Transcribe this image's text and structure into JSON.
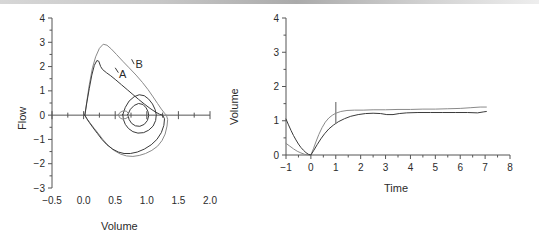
{
  "figure": {
    "background": "#ffffff",
    "line_color_primary": "#3a3a3a",
    "line_color_secondary": "#8a8a8a",
    "axis_color": "#555555",
    "text_color": "#2b2b2b"
  },
  "panels": {
    "left": {
      "name": "flow-volume-loop",
      "xlabel": "Volume",
      "ylabel": "Flow",
      "xticks": [
        "-0.5",
        "0.0",
        "0.5",
        "1.0",
        "1.5",
        "2.0"
      ],
      "yticks": [
        "4",
        "3",
        "2",
        "1",
        "0",
        "-1",
        "-2",
        "-3"
      ],
      "annotations": [
        {
          "label": "A",
          "x": 0.62,
          "y": 1.55
        },
        {
          "label": "B",
          "x": 0.88,
          "y": 1.95
        }
      ]
    },
    "right": {
      "name": "volume-time-curve",
      "xlabel": "Time",
      "ylabel": "Volume",
      "xticks": [
        "-1",
        "0",
        "1",
        "2",
        "3",
        "4",
        "5",
        "6",
        "7",
        "8"
      ],
      "yticks": [
        "4",
        "3",
        "2",
        "1",
        "0"
      ]
    }
  },
  "chart_data": [
    {
      "type": "line",
      "name": "flow-volume-loop",
      "title": "",
      "xlabel": "Volume",
      "ylabel": "Flow",
      "xlim": [
        -0.5,
        2.0
      ],
      "ylim": [
        -3,
        4
      ],
      "xtick_values": [
        -0.5,
        0.0,
        0.5,
        1.0,
        1.5,
        2.0
      ],
      "ytick_values": [
        4,
        3,
        2,
        1,
        0,
        -1,
        -2,
        -3
      ],
      "minor_tick_step_x": 0.25,
      "minor_tick_step_y": 0.5,
      "grid": false,
      "legend": "none",
      "annotations": [
        {
          "text": "A",
          "x": 0.62,
          "y": 1.55
        },
        {
          "text": "B",
          "x": 0.88,
          "y": 1.95
        }
      ],
      "series": [
        {
          "name": "loop-B-outer",
          "color": "#8a8a8a",
          "closed": true,
          "points": [
            [
              0.02,
              0.0
            ],
            [
              0.05,
              0.55
            ],
            [
              0.09,
              1.25
            ],
            [
              0.14,
              1.95
            ],
            [
              0.19,
              2.4
            ],
            [
              0.25,
              2.75
            ],
            [
              0.31,
              2.92
            ],
            [
              0.37,
              2.88
            ],
            [
              0.44,
              2.72
            ],
            [
              0.52,
              2.5
            ],
            [
              0.62,
              2.22
            ],
            [
              0.72,
              1.95
            ],
            [
              0.83,
              1.65
            ],
            [
              0.93,
              1.35
            ],
            [
              1.02,
              1.05
            ],
            [
              1.1,
              0.75
            ],
            [
              1.17,
              0.48
            ],
            [
              1.23,
              0.25
            ],
            [
              1.28,
              0.08
            ],
            [
              1.31,
              0.0
            ],
            [
              1.33,
              -0.18
            ],
            [
              1.32,
              -0.45
            ],
            [
              1.29,
              -0.78
            ],
            [
              1.24,
              -1.05
            ],
            [
              1.17,
              -1.28
            ],
            [
              1.08,
              -1.45
            ],
            [
              0.98,
              -1.58
            ],
            [
              0.88,
              -1.66
            ],
            [
              0.78,
              -1.7
            ],
            [
              0.68,
              -1.68
            ],
            [
              0.58,
              -1.6
            ],
            [
              0.48,
              -1.45
            ],
            [
              0.39,
              -1.25
            ],
            [
              0.31,
              -1.02
            ],
            [
              0.24,
              -0.78
            ],
            [
              0.17,
              -0.55
            ],
            [
              0.11,
              -0.35
            ],
            [
              0.06,
              -0.18
            ],
            [
              0.03,
              -0.06
            ],
            [
              0.02,
              0.0
            ]
          ]
        },
        {
          "name": "loop-A-inner",
          "color": "#3a3a3a",
          "closed": true,
          "points": [
            [
              0.02,
              0.0
            ],
            [
              0.05,
              0.5
            ],
            [
              0.09,
              1.1
            ],
            [
              0.13,
              1.65
            ],
            [
              0.17,
              2.05
            ],
            [
              0.21,
              2.25
            ],
            [
              0.24,
              2.22
            ],
            [
              0.27,
              2.0
            ],
            [
              0.3,
              1.88
            ],
            [
              0.36,
              1.75
            ],
            [
              0.43,
              1.62
            ],
            [
              0.51,
              1.45
            ],
            [
              0.6,
              1.25
            ],
            [
              0.69,
              1.05
            ],
            [
              0.78,
              0.85
            ],
            [
              0.87,
              0.65
            ],
            [
              0.96,
              0.46
            ],
            [
              1.05,
              0.28
            ],
            [
              1.13,
              0.14
            ],
            [
              1.2,
              0.04
            ],
            [
              1.25,
              0.0
            ],
            [
              1.28,
              -0.15
            ],
            [
              1.27,
              -0.42
            ],
            [
              1.23,
              -0.72
            ],
            [
              1.16,
              -1.0
            ],
            [
              1.07,
              -1.22
            ],
            [
              0.96,
              -1.4
            ],
            [
              0.85,
              -1.52
            ],
            [
              0.74,
              -1.58
            ],
            [
              0.64,
              -1.58
            ],
            [
              0.55,
              -1.52
            ],
            [
              0.46,
              -1.4
            ],
            [
              0.37,
              -1.22
            ],
            [
              0.29,
              -1.0
            ],
            [
              0.22,
              -0.76
            ],
            [
              0.15,
              -0.52
            ],
            [
              0.09,
              -0.3
            ],
            [
              0.05,
              -0.14
            ],
            [
              0.02,
              0.0
            ]
          ]
        },
        {
          "name": "tidal-loop-large",
          "color": "#3a3a3a",
          "closed": true,
          "points": [
            [
              0.62,
              0.02
            ],
            [
              0.66,
              0.32
            ],
            [
              0.72,
              0.58
            ],
            [
              0.8,
              0.76
            ],
            [
              0.88,
              0.84
            ],
            [
              0.96,
              0.8
            ],
            [
              1.03,
              0.66
            ],
            [
              1.09,
              0.46
            ],
            [
              1.13,
              0.24
            ],
            [
              1.15,
              0.02
            ],
            [
              1.14,
              -0.22
            ],
            [
              1.1,
              -0.45
            ],
            [
              1.03,
              -0.62
            ],
            [
              0.95,
              -0.72
            ],
            [
              0.86,
              -0.74
            ],
            [
              0.78,
              -0.68
            ],
            [
              0.71,
              -0.55
            ],
            [
              0.66,
              -0.38
            ],
            [
              0.63,
              -0.18
            ],
            [
              0.62,
              0.02
            ]
          ]
        },
        {
          "name": "tidal-loop-small",
          "color": "#3a3a3a",
          "closed": true,
          "points": [
            [
              0.7,
              0.02
            ],
            [
              0.74,
              0.24
            ],
            [
              0.8,
              0.4
            ],
            [
              0.87,
              0.48
            ],
            [
              0.94,
              0.44
            ],
            [
              0.99,
              0.3
            ],
            [
              1.02,
              0.14
            ],
            [
              1.03,
              -0.02
            ],
            [
              1.01,
              -0.22
            ],
            [
              0.96,
              -0.38
            ],
            [
              0.89,
              -0.46
            ],
            [
              0.82,
              -0.44
            ],
            [
              0.76,
              -0.34
            ],
            [
              0.72,
              -0.18
            ],
            [
              0.7,
              0.02
            ]
          ]
        },
        {
          "name": "tidal-loop-tiny",
          "color": "#8a8a8a",
          "closed": true,
          "points": [
            [
              0.55,
              0.02
            ],
            [
              0.58,
              0.12
            ],
            [
              0.63,
              0.18
            ],
            [
              0.68,
              0.16
            ],
            [
              0.71,
              0.06
            ],
            [
              0.71,
              -0.06
            ],
            [
              0.67,
              -0.14
            ],
            [
              0.61,
              -0.16
            ],
            [
              0.57,
              -0.1
            ],
            [
              0.55,
              0.02
            ]
          ]
        }
      ]
    },
    {
      "type": "line",
      "name": "volume-time-curve",
      "title": "",
      "xlabel": "Time",
      "ylabel": "Volume",
      "xlim": [
        -1,
        8
      ],
      "ylim": [
        0,
        4
      ],
      "xtick_values": [
        -1,
        0,
        1,
        2,
        3,
        4,
        5,
        6,
        7,
        8
      ],
      "ytick_values": [
        0,
        1,
        2,
        3,
        4
      ],
      "minor_tick_step_x": 0.5,
      "minor_tick_step_y": 0.5,
      "grid": false,
      "legend": "none",
      "marker_line": {
        "name": "one-second-marker",
        "x": 1.0,
        "y_top": 1.55,
        "y_bottom": 0.92
      },
      "series": [
        {
          "name": "curve-B",
          "color": "#8a8a8a",
          "points": [
            [
              -1.0,
              0.34
            ],
            [
              -0.85,
              0.26
            ],
            [
              -0.7,
              0.18
            ],
            [
              -0.55,
              0.11
            ],
            [
              -0.4,
              0.06
            ],
            [
              -0.25,
              0.02
            ],
            [
              -0.1,
              0.0
            ],
            [
              0.0,
              0.0
            ],
            [
              0.1,
              0.18
            ],
            [
              0.2,
              0.38
            ],
            [
              0.32,
              0.6
            ],
            [
              0.45,
              0.8
            ],
            [
              0.58,
              0.96
            ],
            [
              0.72,
              1.08
            ],
            [
              0.86,
              1.16
            ],
            [
              1.0,
              1.22
            ],
            [
              1.2,
              1.27
            ],
            [
              1.45,
              1.3
            ],
            [
              1.75,
              1.31
            ],
            [
              2.1,
              1.31
            ],
            [
              2.5,
              1.32
            ],
            [
              3.0,
              1.32
            ],
            [
              3.5,
              1.33
            ],
            [
              4.0,
              1.33
            ],
            [
              4.5,
              1.34
            ],
            [
              5.0,
              1.34
            ],
            [
              5.5,
              1.35
            ],
            [
              6.0,
              1.36
            ],
            [
              6.4,
              1.38
            ],
            [
              6.8,
              1.4
            ],
            [
              7.05,
              1.4
            ]
          ]
        },
        {
          "name": "curve-A",
          "color": "#3a3a3a",
          "points": [
            [
              -1.0,
              1.05
            ],
            [
              -0.9,
              0.88
            ],
            [
              -0.8,
              0.72
            ],
            [
              -0.7,
              0.57
            ],
            [
              -0.6,
              0.44
            ],
            [
              -0.5,
              0.32
            ],
            [
              -0.4,
              0.22
            ],
            [
              -0.3,
              0.14
            ],
            [
              -0.2,
              0.07
            ],
            [
              -0.1,
              0.02
            ],
            [
              0.0,
              0.0
            ],
            [
              0.12,
              0.14
            ],
            [
              0.25,
              0.3
            ],
            [
              0.4,
              0.47
            ],
            [
              0.55,
              0.62
            ],
            [
              0.72,
              0.76
            ],
            [
              0.9,
              0.87
            ],
            [
              1.1,
              0.97
            ],
            [
              1.35,
              1.06
            ],
            [
              1.6,
              1.13
            ],
            [
              1.9,
              1.18
            ],
            [
              2.2,
              1.21
            ],
            [
              2.5,
              1.22
            ],
            [
              2.8,
              1.21
            ],
            [
              3.05,
              1.18
            ],
            [
              3.3,
              1.18
            ],
            [
              3.55,
              1.21
            ],
            [
              3.85,
              1.23
            ],
            [
              4.3,
              1.24
            ],
            [
              4.8,
              1.24
            ],
            [
              5.3,
              1.24
            ],
            [
              5.8,
              1.24
            ],
            [
              6.3,
              1.24
            ],
            [
              6.7,
              1.23
            ],
            [
              6.95,
              1.26
            ],
            [
              7.05,
              1.27
            ]
          ]
        }
      ]
    }
  ]
}
